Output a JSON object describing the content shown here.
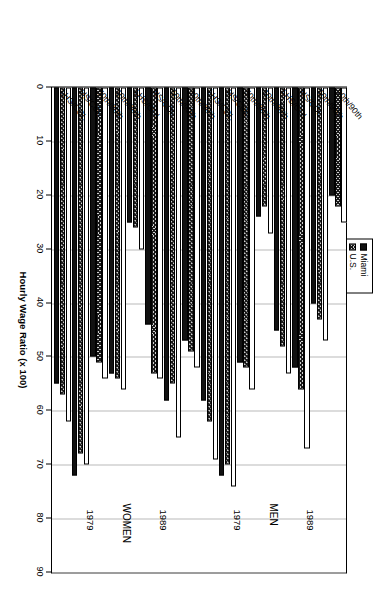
{
  "chart_data": {
    "type": "bar",
    "orientation": "horizontal",
    "title": "",
    "xlabel": "",
    "ylabel": "Hourly Wage Ratio (x 100)",
    "ylim": [
      0,
      90
    ],
    "yticks": [
      0,
      10,
      20,
      30,
      40,
      50,
      60,
      70,
      80,
      90
    ],
    "grid": true,
    "legend_position": "top-center",
    "legend": [
      "Miami",
      "U.S.",
      "St. Louis"
    ],
    "panel_labels": [
      "WOMEN",
      "MEN"
    ],
    "year_labels": [
      "1979",
      "1989",
      "1979",
      "1989"
    ],
    "categories": [
      "LHS/COL",
      "HS/COL",
      "50th/90th",
      "10th/90th"
    ],
    "groups": [
      {
        "panel": "WOMEN",
        "year": "1979",
        "categories": [
          "LHS/COL",
          "HS/COL",
          "50th/90th",
          "10th/90th"
        ],
        "series": [
          {
            "name": "Miami",
            "values": [
              55,
              72,
              50,
              53
            ]
          },
          {
            "name": "U.S.",
            "values": [
              57,
              68,
              51,
              54
            ]
          },
          {
            "name": "St. Louis",
            "values": [
              62,
              70,
              54,
              56
            ]
          }
        ]
      },
      {
        "panel": "WOMEN",
        "year": "1989",
        "categories": [
          "LHS/COL",
          "HS/COL",
          "50th/90th",
          "10th/90th"
        ],
        "series": [
          {
            "name": "Miami",
            "values": [
              25,
              44,
              58,
              47
            ]
          },
          {
            "name": "U.S.",
            "values": [
              26,
              53,
              55,
              49
            ]
          },
          {
            "name": "St. Louis",
            "values": [
              30,
              54,
              65,
              52
            ]
          }
        ]
      },
      {
        "panel": "MEN",
        "year": "1979",
        "categories": [
          "LHS/COL",
          "HS/COL",
          "50th/90th",
          "10th/90th"
        ],
        "series": [
          {
            "name": "Miami",
            "values": [
              58,
              72,
              51,
              24
            ]
          },
          {
            "name": "U.S.",
            "values": [
              62,
              70,
              52,
              22
            ]
          },
          {
            "name": "St. Louis",
            "values": [
              69,
              74,
              56,
              27
            ]
          }
        ]
      },
      {
        "panel": "MEN",
        "year": "1989",
        "categories": [
          "LHS/COL",
          "HS/COL",
          "50th/90th",
          "10th/90th"
        ],
        "series": [
          {
            "name": "Miami",
            "values": [
              45,
              52,
              40,
              20
            ]
          },
          {
            "name": "U.S.",
            "values": [
              48,
              56,
              43,
              22
            ]
          },
          {
            "name": "St. Louis",
            "values": [
              53,
              67,
              47,
              25
            ]
          }
        ]
      }
    ]
  },
  "axis": {
    "value_axis_title": "Hourly Wage Ratio (x 100)",
    "tick_labels": [
      "0",
      "10",
      "20",
      "30",
      "40",
      "50",
      "60",
      "70",
      "80",
      "90"
    ]
  },
  "legend": {
    "items": [
      {
        "label": "Miami",
        "style": "solid-black"
      },
      {
        "label": "U.S.",
        "style": "hatched"
      },
      {
        "label": "St. Louis",
        "style": "open-white"
      }
    ]
  },
  "panels": [
    {
      "name": "WOMEN",
      "years": [
        "1979",
        "1989"
      ]
    },
    {
      "name": "MEN",
      "years": [
        "1979",
        "1989"
      ]
    }
  ],
  "colors": {
    "miami": "#111111",
    "us": "#cfcfcf",
    "st_louis": "#ffffff",
    "grid": "#b9b9b9",
    "axis": "#000000"
  }
}
